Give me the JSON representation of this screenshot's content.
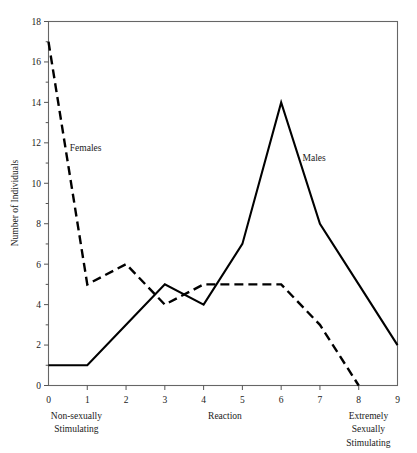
{
  "chart_data": {
    "type": "line",
    "title": "",
    "xlabel": "Reaction",
    "ylabel": "Number of Individuals",
    "xlim": [
      0,
      9
    ],
    "ylim": [
      0,
      18
    ],
    "grid": false,
    "legend_position": "inline-annotations",
    "x": [
      0,
      1,
      2,
      3,
      4,
      5,
      6,
      7,
      8,
      9
    ],
    "x_tick_labels": [
      "0",
      "1",
      "2",
      "3",
      "4",
      "5",
      "6",
      "7",
      "8",
      "9"
    ],
    "y_tick_labels": [
      "0",
      "2",
      "4",
      "6",
      "8",
      "10",
      "12",
      "14",
      "16",
      "18"
    ],
    "y_major_ticks": [
      0,
      2,
      4,
      6,
      8,
      10,
      12,
      14,
      16,
      18
    ],
    "y_minor_ticks": [
      1,
      3,
      5,
      7,
      9,
      11,
      13,
      15,
      17
    ],
    "series": [
      {
        "name": "Males",
        "style": "solid",
        "color": "#000000",
        "x": [
          0,
          1,
          2,
          3,
          4,
          5,
          6,
          7,
          8,
          9
        ],
        "values": [
          1,
          1,
          3,
          5,
          4,
          7,
          14,
          8,
          5,
          2
        ],
        "label_x": 6.55,
        "label_y": 11.1
      },
      {
        "name": "Females",
        "style": "dashed",
        "color": "#000000",
        "x": [
          0,
          1,
          2,
          3,
          4,
          5,
          6,
          7,
          8
        ],
        "values": [
          17,
          5,
          6,
          4,
          5,
          5,
          5,
          3,
          0
        ],
        "label_x": 0.55,
        "label_y": 11.6
      }
    ],
    "axis_end_captions": {
      "left": [
        "Non-sexually",
        "Stimulating"
      ],
      "center": [
        "Reaction"
      ],
      "right": [
        "Extremely",
        "Sexually",
        "Stimulating"
      ]
    }
  }
}
